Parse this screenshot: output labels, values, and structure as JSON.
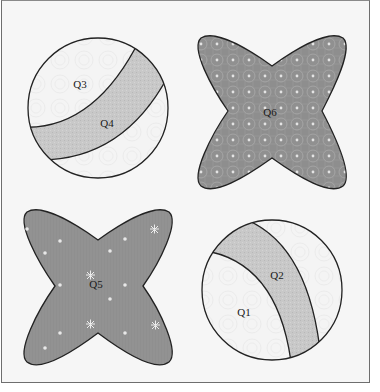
{
  "figure": {
    "background": "#f6f6f6",
    "frame_color": "#6e6e6e",
    "outline_color": "#222222"
  },
  "shapes": [
    {
      "id": "circle-top-left",
      "type": "circle-with-band",
      "center": [
        98,
        108
      ],
      "radius": 70,
      "fill": "#f3f3f3",
      "band_fill": "#c6c6c6",
      "regions": [
        {
          "label": "Q3",
          "role": "outer-region",
          "label_pos": [
            80,
            88
          ]
        },
        {
          "label": "Q4",
          "role": "band",
          "label_pos": [
            107,
            127
          ]
        }
      ]
    },
    {
      "id": "x-shape-top-right",
      "type": "four-lobed-x",
      "center": [
        273,
        112
      ],
      "fill": "#8e8e8e",
      "pattern": "ringed-dots",
      "regions": [
        {
          "label": "Q6",
          "role": "x-shape",
          "label_pos": [
            270,
            116
          ]
        }
      ]
    },
    {
      "id": "x-shape-bottom-left",
      "type": "four-lobed-x",
      "center": [
        98,
        287
      ],
      "fill": "#8f8f8f",
      "pattern": "stars",
      "regions": [
        {
          "label": "Q5",
          "role": "x-shape",
          "label_pos": [
            96,
            288
          ]
        }
      ]
    },
    {
      "id": "circle-bottom-right",
      "type": "circle-with-band",
      "center": [
        272,
        290
      ],
      "radius": 70,
      "fill": "#f3f3f3",
      "band_fill": "#c6c6c6",
      "regions": [
        {
          "label": "Q2",
          "role": "band",
          "label_pos": [
            277,
            279
          ]
        },
        {
          "label": "Q1",
          "role": "inner-region",
          "label_pos": [
            244,
            316
          ]
        }
      ]
    }
  ],
  "labels": {
    "q1": "Q1",
    "q2": "Q2",
    "q3": "Q3",
    "q4": "Q4",
    "q5": "Q5",
    "q6": "Q6"
  }
}
